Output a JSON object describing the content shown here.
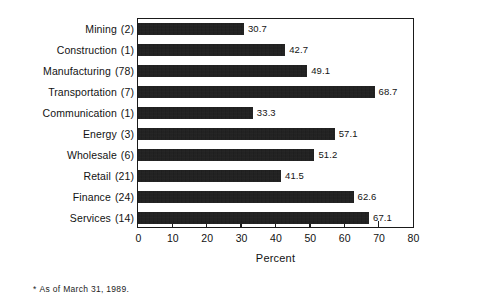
{
  "chart_data": {
    "type": "bar",
    "orientation": "horizontal",
    "title": "",
    "subtitle": "",
    "xlabel": "Percent",
    "ylabel": "",
    "xlim": [
      0,
      80
    ],
    "xticks": [
      0,
      10,
      20,
      30,
      40,
      50,
      60,
      70,
      80
    ],
    "xtick_labels": [
      "0",
      "10",
      "20",
      "30",
      "40",
      "50",
      "60",
      "70",
      "80"
    ],
    "grid": false,
    "legend": null,
    "legend_position": "none",
    "bar_color": "#191919",
    "frame_color": "#1a1a1a",
    "categories": [
      "Mining  (2)",
      "Construction  (1)",
      "Manufacturing  (78)",
      "Transportation  (7)",
      "Communication  (1)",
      "Energy  (3)",
      "Wholesale  (6)",
      "Retail  (21)",
      "Finance  (24)",
      "Services  (14)"
    ],
    "category_names": [
      "Mining",
      "Construction",
      "Manufacturing",
      "Transportation",
      "Communication",
      "Energy",
      "Wholesale",
      "Retail",
      "Finance",
      "Services"
    ],
    "category_counts": [
      "(2)",
      "(1)",
      "(78)",
      "(7)",
      "(1)",
      "(3)",
      "(6)",
      "(21)",
      "(24)",
      "(14)"
    ],
    "values": [
      30.7,
      42.7,
      49.1,
      68.7,
      33.3,
      57.1,
      51.2,
      41.5,
      62.6,
      67.1
    ],
    "value_labels": [
      "30.7",
      "42.7",
      "49.1",
      "68.7",
      "33.3",
      "57.1",
      "51.2",
      "41.5",
      "62.6",
      "67.1"
    ],
    "annotations": [
      "* As of March 31, 1989."
    ]
  },
  "footnote": {
    "star": "*",
    "text": "As of March 31, 1989."
  },
  "axis": {
    "title": "Percent"
  }
}
